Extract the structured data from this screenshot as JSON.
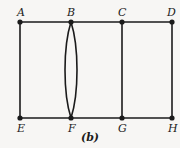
{
  "figure": {
    "caption": "(b)",
    "background_color": "#f7f6f4",
    "ink_color": "#1b1b1b",
    "width": 180,
    "height": 148
  },
  "chart_data": {
    "type": "diagram",
    "diagram_kind": "undirected-multigraph",
    "title": "(b)",
    "vertex_labels": [
      "A",
      "B",
      "C",
      "D",
      "E",
      "F",
      "G",
      "H"
    ],
    "vertices": [
      {
        "id": "A",
        "label": "A",
        "x": 20,
        "y": 22,
        "label_x": 17,
        "label_y": 7,
        "degree": 2
      },
      {
        "id": "B",
        "label": "B",
        "x": 71,
        "y": 22,
        "label_x": 67,
        "label_y": 7,
        "degree": 4
      },
      {
        "id": "C",
        "label": "C",
        "x": 122,
        "y": 22,
        "label_x": 118,
        "label_y": 7,
        "degree": 3
      },
      {
        "id": "D",
        "label": "D",
        "x": 172,
        "y": 22,
        "label_x": 167,
        "label_y": 7,
        "degree": 2
      },
      {
        "id": "E",
        "label": "E",
        "x": 20,
        "y": 118,
        "label_x": 17,
        "label_y": 123,
        "degree": 2
      },
      {
        "id": "F",
        "label": "F",
        "x": 71,
        "y": 118,
        "label_x": 68,
        "label_y": 123,
        "degree": 4
      },
      {
        "id": "G",
        "label": "G",
        "x": 122,
        "y": 118,
        "label_x": 118,
        "label_y": 123,
        "degree": 3
      },
      {
        "id": "H",
        "label": "H",
        "x": 172,
        "y": 118,
        "label_x": 168,
        "label_y": 123,
        "degree": 2
      }
    ],
    "edges": [
      {
        "id": "AB",
        "from": "A",
        "to": "B",
        "shape": "straight"
      },
      {
        "id": "BC",
        "from": "B",
        "to": "C",
        "shape": "straight"
      },
      {
        "id": "CD",
        "from": "C",
        "to": "D",
        "shape": "straight"
      },
      {
        "id": "EF",
        "from": "E",
        "to": "F",
        "shape": "straight"
      },
      {
        "id": "FG",
        "from": "F",
        "to": "G",
        "shape": "straight"
      },
      {
        "id": "GH",
        "from": "G",
        "to": "H",
        "shape": "straight"
      },
      {
        "id": "AE",
        "from": "A",
        "to": "E",
        "shape": "straight"
      },
      {
        "id": "CG",
        "from": "C",
        "to": "G",
        "shape": "straight"
      },
      {
        "id": "DH",
        "from": "D",
        "to": "H",
        "shape": "straight"
      },
      {
        "id": "BF-left",
        "from": "B",
        "to": "F",
        "shape": "curved-left",
        "bulge": 8
      },
      {
        "id": "BF-right",
        "from": "B",
        "to": "F",
        "shape": "curved-right",
        "bulge": 8
      }
    ],
    "edge_count": 11,
    "vertex_count": 8,
    "vertex_dot_radius": 2.6,
    "line_width": 1.6,
    "caption_x": 90,
    "caption_y": 132
  }
}
